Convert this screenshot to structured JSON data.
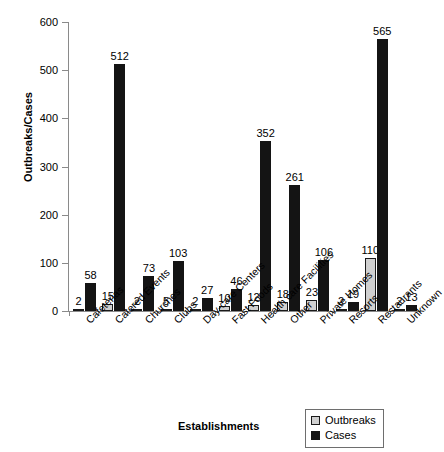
{
  "chart_data": {
    "type": "bar",
    "title": "",
    "xlabel": "Establishments",
    "ylabel": "Outbreaks/Cases",
    "ylim": [
      0,
      600
    ],
    "ytick_step": 100,
    "yticks": [
      600,
      500,
      400,
      300,
      200,
      100,
      0
    ],
    "grid": false,
    "legend_position": "bottom-right",
    "categories": [
      "Cafeterias",
      "Catered Events",
      "Churches",
      "Clubs",
      "Day-care Centers",
      "Fast Foods",
      "Health care Facilities",
      "Other",
      "Private Homes",
      "Resorts",
      "Restaurants",
      "Unknown"
    ],
    "series": [
      {
        "name": "Outbreaks",
        "color": "#d0d0d0",
        "values": [
          2,
          15,
          2,
          5,
          2,
          10,
          12,
          18,
          23,
          2,
          110,
          2
        ]
      },
      {
        "name": "Cases",
        "color": "#141414",
        "values": [
          58,
          512,
          73,
          103,
          27,
          46,
          352,
          261,
          106,
          19,
          565,
          13
        ]
      }
    ]
  },
  "legend": {
    "items": [
      {
        "label": "Outbreaks",
        "swatch": "outbreaks"
      },
      {
        "label": "Cases",
        "swatch": "cases"
      }
    ]
  }
}
